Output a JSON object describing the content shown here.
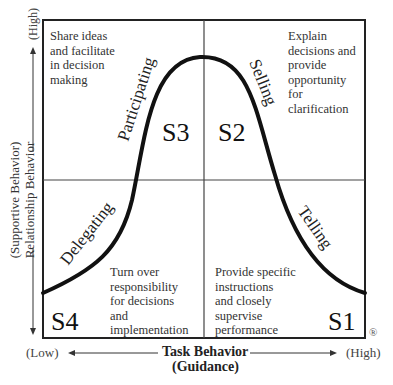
{
  "diagram": {
    "type": "situational-leadership-model",
    "y_axis": {
      "label_line1": "(Supportive Behavior)",
      "label_line2": "Relationship Behavior",
      "high": "(High)",
      "low": "(Low)"
    },
    "x_axis": {
      "label_line1": "Task Behavior",
      "label_line2": "(Guidance)",
      "low": "(Low)",
      "high": "(High)"
    },
    "quadrants": [
      {
        "id": "S3",
        "position": "top-left",
        "style": "Participating",
        "description": [
          "Share ideas",
          "and facilitate",
          "in decision",
          "making"
        ]
      },
      {
        "id": "S2",
        "position": "top-right",
        "style": "Selling",
        "description": [
          "Explain",
          "decisions and",
          "provide",
          "opportunity",
          "for",
          "clarification"
        ]
      },
      {
        "id": "S4",
        "position": "bottom-left",
        "style": "Delegating",
        "description": [
          "Turn over",
          "responsibility",
          "for decisions",
          "and",
          "implementation"
        ]
      },
      {
        "id": "S1",
        "position": "bottom-right",
        "style": "Telling",
        "description": [
          "Provide specific",
          "instructions",
          "and closely",
          "supervise",
          "performance"
        ]
      }
    ],
    "registered_mark": "®"
  }
}
